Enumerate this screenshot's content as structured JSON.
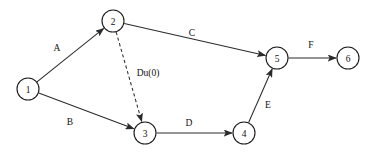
{
  "diagram": {
    "type": "directed-graph",
    "canvas": {
      "width": 380,
      "height": 154
    },
    "style": {
      "background": "#ffffff",
      "node_fill": "#ffffff",
      "node_stroke": "#1a1a1a",
      "edge_color": "#2b2b2b",
      "label_color": "#111111"
    },
    "nodes": [
      {
        "id": "n1",
        "label": "1",
        "cx": 28,
        "cy": 89,
        "r": 11
      },
      {
        "id": "n2",
        "label": "2",
        "cx": 113,
        "cy": 21,
        "r": 11
      },
      {
        "id": "n3",
        "label": "3",
        "cx": 145,
        "cy": 133,
        "r": 11
      },
      {
        "id": "n4",
        "label": "4",
        "cx": 244,
        "cy": 133,
        "r": 11
      },
      {
        "id": "n5",
        "label": "5",
        "cx": 277,
        "cy": 58,
        "r": 11
      },
      {
        "id": "n6",
        "label": "6",
        "cx": 348,
        "cy": 58,
        "r": 11
      }
    ],
    "edges": [
      {
        "id": "e_a",
        "label": "A",
        "from": "n1",
        "to": "n2",
        "style": "solid",
        "label_x": 57,
        "label_y": 48
      },
      {
        "id": "e_b",
        "label": "B",
        "from": "n1",
        "to": "n3",
        "style": "solid",
        "label_x": 70,
        "label_y": 122
      },
      {
        "id": "e_c",
        "label": "C",
        "from": "n2",
        "to": "n5",
        "style": "solid",
        "label_x": 192,
        "label_y": 33
      },
      {
        "id": "e_du",
        "label": "Du(0)",
        "from": "n2",
        "to": "n3",
        "style": "dashed",
        "label_x": 148,
        "label_y": 73
      },
      {
        "id": "e_d",
        "label": "D",
        "from": "n3",
        "to": "n4",
        "style": "solid",
        "label_x": 189,
        "label_y": 123
      },
      {
        "id": "e_e",
        "label": "E",
        "from": "n4",
        "to": "n5",
        "style": "solid",
        "label_x": 268,
        "label_y": 105
      },
      {
        "id": "e_f",
        "label": "F",
        "from": "n5",
        "to": "n6",
        "style": "solid",
        "label_x": 311,
        "label_y": 45
      }
    ]
  }
}
